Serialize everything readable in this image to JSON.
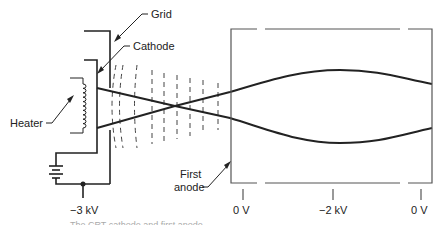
{
  "diagram": {
    "labels": {
      "grid": "Grid",
      "cathode": "Cathode",
      "heater": "Heater",
      "first_anode_line1": "First",
      "first_anode_line2": "anode"
    },
    "voltages": {
      "cathode_supply": "−3 kV",
      "anode_left": "0 V",
      "anode_middle": "−2 kV",
      "anode_right": "0 V"
    },
    "caption": "The CRT cathode and first anode"
  },
  "colors": {
    "line": "#222222",
    "faint": "#aaaaaa"
  }
}
